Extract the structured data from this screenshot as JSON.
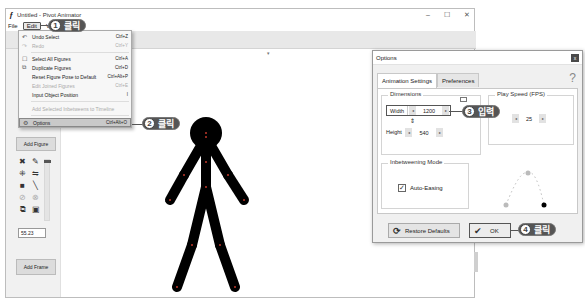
{
  "window": {
    "title": "Untitled - Pivot Animator",
    "controls": {
      "minimize": "–",
      "maximize": "☐",
      "close": "✕"
    }
  },
  "menubar": {
    "items": [
      {
        "label": "File"
      },
      {
        "label": "Edit",
        "active": true
      },
      {
        "label": "View"
      }
    ]
  },
  "edit_menu": {
    "items": [
      {
        "label": "Undo Select",
        "shortcut": "Ctrl+Z",
        "icon": "undo-icon",
        "disabled": false
      },
      {
        "label": "Redo",
        "shortcut": "Ctrl+Y",
        "icon": "redo-icon",
        "disabled": true
      },
      {
        "label": "Select All Figures",
        "shortcut": "Ctrl+A",
        "icon": "select-all-icon",
        "disabled": false
      },
      {
        "label": "Duplicate Figures",
        "shortcut": "Ctrl+D",
        "icon": "duplicate-icon",
        "disabled": false
      },
      {
        "label": "Reset Figure Pose to Default",
        "shortcut": "Ctrl+Alt+P",
        "disabled": false
      },
      {
        "label": "Edit Joined Figures",
        "shortcut": "Ctrl+E",
        "disabled": true
      },
      {
        "label": "Input Object Position",
        "shortcut": "I",
        "disabled": false
      },
      {
        "label": "Add Selected Inbetweens to Timeline",
        "shortcut": "",
        "disabled": true
      },
      {
        "label": "Options",
        "shortcut": "Ctrl+Alt+O",
        "icon": "options-icon",
        "disabled": false,
        "highlighted": true
      }
    ]
  },
  "left_panel": {
    "add_figure": "Add Figure",
    "scale_value": "55.23",
    "add_frame": "Add Frame"
  },
  "callouts": [
    {
      "num": "1",
      "text": "클릭"
    },
    {
      "num": "2",
      "text": "클릭"
    },
    {
      "num": "3",
      "text": "입력"
    },
    {
      "num": "4",
      "text": "클릭"
    }
  ],
  "options_dialog": {
    "title": "Options",
    "close": "x",
    "help": "?",
    "tabs": [
      {
        "label": "Animation Settings",
        "active": true
      },
      {
        "label": "Preferences",
        "active": false
      }
    ],
    "dimensions": {
      "title": "Dimensions",
      "width_label": "Width",
      "width_value": "1200",
      "height_label": "Height",
      "height_value": "540",
      "link_icon": "⇕"
    },
    "play_speed": {
      "title": "Play Speed (FPS)",
      "value": "25"
    },
    "inbetweening": {
      "title": "Inbetweening Mode",
      "auto_easing_label": "Auto-Easing",
      "auto_easing_checked": true
    },
    "buttons": {
      "restore_defaults": "Restore Defaults",
      "ok": "OK"
    }
  },
  "arrows": {
    "left": "◂",
    "right": "▸"
  }
}
